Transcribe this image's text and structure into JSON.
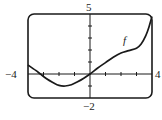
{
  "chart_data": {
    "type": "line",
    "title": "",
    "xlabel": "",
    "ylabel": "",
    "xlim": [
      -4,
      4
    ],
    "ylim": [
      -2,
      5
    ],
    "grid": false,
    "x_tick_step": 1,
    "y_tick_step": 1,
    "axis_labels": {
      "xmin": "−4",
      "xmax": "4",
      "ymin": "−2",
      "ymax": "5"
    },
    "series": [
      {
        "name": "f",
        "x": [
          -4,
          -3.5,
          -3.2,
          -2.8,
          -2.4,
          -2.0,
          -1.6,
          -1.2,
          -0.8,
          -0.4,
          0,
          0.5,
          1.0,
          1.5,
          2.0,
          2.5,
          3.0,
          3.3,
          3.6,
          3.8,
          4.0
        ],
        "values": [
          0.75,
          0.3,
          0.0,
          -0.4,
          -0.7,
          -0.95,
          -1.0,
          -0.9,
          -0.65,
          -0.35,
          0,
          0.5,
          0.95,
          1.4,
          1.75,
          1.95,
          2.15,
          2.5,
          3.2,
          3.9,
          4.8
        ]
      }
    ],
    "annotations": [
      {
        "text": "f",
        "x": 2.3,
        "y": 2.7
      }
    ]
  },
  "labels": {
    "xmin": "−4",
    "xmax": "4",
    "ymin": "−2",
    "ymax": "5",
    "curve": "f"
  }
}
